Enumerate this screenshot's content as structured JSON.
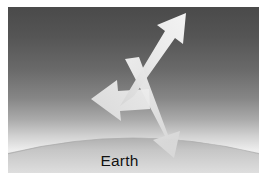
{
  "figure": {
    "caption_label": "Earth",
    "background": {
      "sky_top_color": "#4f4f4f",
      "sky_mid_color": "#8f8f8f",
      "airglow_color": "#f2f2f2",
      "space_edge_color": "#5a5a5a",
      "frame_border_color": "#ffffff"
    },
    "earth": {
      "name": "earth-limb",
      "surface_top_color": "#bdbdbd",
      "surface_bottom_color": "#d8d8d8",
      "limb_apex_y": 133
    },
    "arrows": [
      {
        "id": "upward-arrow",
        "label": "",
        "direction": "up-right",
        "description": "outgoing radiation escaping to space",
        "color": "#e8e8e8",
        "tip_x": 178,
        "tip_y": 6,
        "tail_x": 118,
        "tail_y": 96
      },
      {
        "id": "left-arrow",
        "label": "",
        "direction": "left",
        "description": "scattered radiation toward the limb",
        "color": "#e4e4e4",
        "tip_x": 83,
        "tip_y": 92,
        "tail_x": 131,
        "tail_y": 96
      },
      {
        "id": "downward-arrow",
        "label": "",
        "direction": "down-right",
        "description": "incoming radiation toward Earth surface",
        "color": "#e2e2e2",
        "tip_x": 166,
        "tip_y": 146,
        "tail_x": 124,
        "tail_y": 60
      }
    ]
  }
}
